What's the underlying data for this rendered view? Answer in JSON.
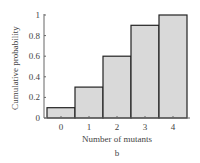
{
  "chart_data": {
    "type": "bar",
    "title": "",
    "xlabel": "Number of mutants",
    "ylabel": "Cumulative probability",
    "categories": [
      "0",
      "1",
      "2",
      "3",
      "4"
    ],
    "values": [
      0.1,
      0.3,
      0.6,
      0.9,
      1.0
    ],
    "ylim": [
      0,
      1
    ],
    "yticks": [
      "0",
      "0.2",
      "0.4",
      "0.6",
      "0.8",
      "1"
    ],
    "grid": false,
    "legend": null,
    "bar_color": "#d9d9d9",
    "bar_edge_color": "#222222",
    "panel_label": "b"
  }
}
